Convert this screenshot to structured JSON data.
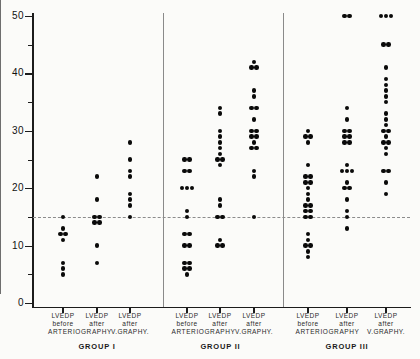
{
  "figure": {
    "background": "#fbfbf9",
    "dot_color": "#0a0a0a"
  },
  "chart_data": {
    "type": "scatter",
    "title": "",
    "xlabel": "",
    "ylabel": "",
    "ylim": [
      0,
      50
    ],
    "yticks": [
      0,
      10,
      20,
      30,
      40,
      50
    ],
    "ytick_labels": [
      "0",
      "10",
      "20",
      "30",
      "40",
      "50"
    ],
    "minor_tick_step": 5,
    "grid": false,
    "legend": null,
    "reference_line_y": 15,
    "groups": [
      {
        "label": "GROUP I",
        "shared_sublabel": "ARTERIOGRAPHY",
        "columns": [
          {
            "label_lines": [
              "LVEDP",
              "before"
            ],
            "values": [
              15,
              13,
              12,
              12,
              11,
              7,
              6,
              5
            ]
          },
          {
            "label_lines": [
              "LVEDP",
              "after"
            ],
            "values": [
              22,
              18,
              15,
              15,
              14,
              14,
              10,
              7
            ]
          },
          {
            "label_lines": [
              "LVEDP",
              "after",
              "V.GRAPHY."
            ],
            "values": [
              28,
              25,
              23,
              22,
              19,
              18,
              17,
              15
            ]
          }
        ]
      },
      {
        "label": "GROUP II",
        "shared_sublabel": "ARTERIOGRAPHY",
        "columns": [
          {
            "label_lines": [
              "LVEDP",
              "before"
            ],
            "values": [
              25,
              25,
              23,
              23,
              20,
              20,
              20,
              16,
              15,
              12,
              12,
              10,
              10,
              7,
              7,
              6,
              6,
              5
            ]
          },
          {
            "label_lines": [
              "LVEDP",
              "after"
            ],
            "values": [
              34,
              33,
              30,
              29,
              28,
              27,
              26,
              25,
              25,
              24,
              18,
              17,
              15,
              15,
              11,
              10,
              10
            ]
          },
          {
            "label_lines": [
              "LVEDP",
              "after",
              "V.GRAPHY."
            ],
            "values": [
              42,
              41,
              41,
              37,
              36,
              34,
              34,
              32,
              30,
              30,
              29,
              29,
              28,
              27,
              27,
              23,
              22,
              15
            ]
          }
        ]
      },
      {
        "label": "GROUP III",
        "shared_sublabel": "ARTERIOGRAPHY",
        "columns": [
          {
            "label_lines": [
              "LVEDP",
              "before"
            ],
            "values": [
              30,
              29,
              29,
              28,
              24,
              22,
              22,
              21,
              21,
              20,
              19,
              18,
              17,
              17,
              16,
              16,
              15,
              15,
              12,
              11,
              10,
              10,
              9,
              8
            ]
          },
          {
            "label_lines": [
              "LVEDP",
              "after"
            ],
            "values": [
              50,
              50,
              34,
              32,
              30,
              30,
              29,
              29,
              28,
              28,
              24,
              23,
              23,
              23,
              21,
              20,
              20,
              18,
              16,
              15,
              13
            ]
          },
          {
            "label_lines": [
              "LVEDP",
              "after",
              "V.GRAPHY."
            ],
            "values": [
              50,
              50,
              50,
              45,
              45,
              41,
              39,
              38,
              37,
              36,
              35,
              33,
              32,
              31,
              30,
              30,
              29,
              28,
              28,
              27,
              26,
              23,
              23,
              21,
              19
            ]
          }
        ]
      }
    ]
  }
}
